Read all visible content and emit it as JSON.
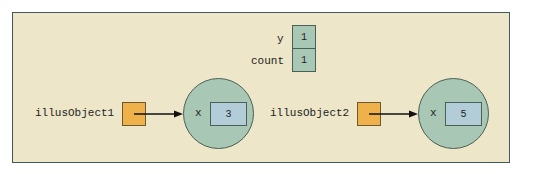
{
  "static_vars": [
    {
      "name": "y",
      "value": "1"
    },
    {
      "name": "count",
      "value": "1"
    }
  ],
  "objects": [
    {
      "ref_name": "illusObject1",
      "field_name": "x",
      "field_value": "3"
    },
    {
      "ref_name": "illusObject2",
      "field_name": "x",
      "field_value": "5"
    }
  ],
  "colors": {
    "panel_bg": "#ede6c8",
    "panel_border": "#3f5a5a",
    "static_cell": "#a8c7b5",
    "reference_box": "#efb24a",
    "object_circle": "#a8c7b5",
    "field_box": "#b3cdd8"
  }
}
